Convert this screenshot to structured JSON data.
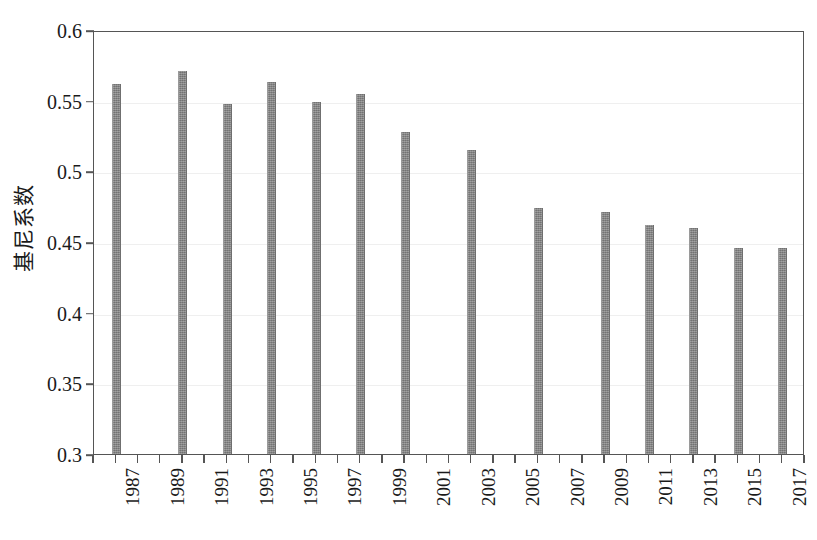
{
  "chart_data": {
    "type": "bar",
    "title": "",
    "subtitle": "",
    "xlabel": "",
    "ylabel": "基尼系数",
    "ylim": [
      0.3,
      0.6
    ],
    "ytick_labels": [
      "0.3",
      "0.35",
      "0.4",
      "0.45",
      "0.5",
      "0.55",
      "0.6"
    ],
    "ytick_values": [
      0.3,
      0.35,
      0.4,
      0.45,
      0.5,
      0.55,
      0.6
    ],
    "xlim": [
      1986,
      2018
    ],
    "xtick_labels": [
      "1987",
      "1989",
      "1991",
      "1993",
      "1995",
      "1997",
      "1999",
      "2001",
      "2003",
      "2005",
      "2007",
      "2009",
      "2011",
      "2013",
      "2015",
      "2017"
    ],
    "xtick_values": [
      1987,
      1989,
      1991,
      1993,
      1995,
      1997,
      1999,
      2001,
      2003,
      2005,
      2007,
      2009,
      2011,
      2013,
      2015,
      2017
    ],
    "minor_xticks": [
      1986,
      1988,
      1990,
      1992,
      1994,
      1996,
      1998,
      2000,
      2002,
      2004,
      2006,
      2008,
      2010,
      2012,
      2014,
      2016,
      2018
    ],
    "grid": "horizontal",
    "legend": "none",
    "bar_color": "#828282",
    "frame_color": "#555555",
    "gridline_color": "#efefef",
    "categories": [
      1987,
      1990,
      1992,
      1994,
      1996,
      1998,
      2000,
      2003,
      2006,
      2009,
      2011,
      2013,
      2015,
      2017
    ],
    "values": [
      0.562,
      0.571,
      0.548,
      0.563,
      0.549,
      0.555,
      0.528,
      0.515,
      0.474,
      0.471,
      0.462,
      0.46,
      0.446,
      0.446
    ],
    "series": [
      {
        "name": "基尼系数",
        "points": [
          {
            "x": 1987,
            "y": 0.562
          },
          {
            "x": 1990,
            "y": 0.571
          },
          {
            "x": 1992,
            "y": 0.548
          },
          {
            "x": 1994,
            "y": 0.563
          },
          {
            "x": 1996,
            "y": 0.549
          },
          {
            "x": 1998,
            "y": 0.555
          },
          {
            "x": 2000,
            "y": 0.528
          },
          {
            "x": 2003,
            "y": 0.515
          },
          {
            "x": 2006,
            "y": 0.474
          },
          {
            "x": 2009,
            "y": 0.471
          },
          {
            "x": 2011,
            "y": 0.462
          },
          {
            "x": 2013,
            "y": 0.46
          },
          {
            "x": 2015,
            "y": 0.446
          },
          {
            "x": 2017,
            "y": 0.446
          }
        ]
      }
    ]
  }
}
